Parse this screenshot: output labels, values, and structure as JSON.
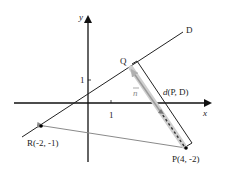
{
  "diagram": {
    "axes": {
      "x_label": "x",
      "y_label": "y",
      "x_tick": "1",
      "y_tick": "1"
    },
    "line": {
      "label": "D"
    },
    "points": {
      "Q": {
        "label": "Q"
      },
      "P": {
        "label": "P(4, -2)"
      },
      "R": {
        "label": "R(-2, -1)"
      }
    },
    "vector_n": {
      "label": "n"
    },
    "distance": {
      "label_prefix": "d",
      "label_args": "(P, D)"
    },
    "colors": {
      "axis": "#111111",
      "line": "#222222",
      "vector": "#aaaaaa",
      "arrow_gray": "#8a8a8a",
      "point": "#000000"
    }
  }
}
